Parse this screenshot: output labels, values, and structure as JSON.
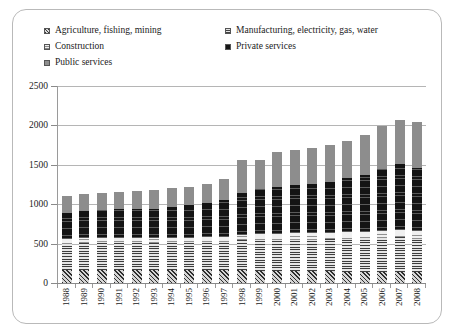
{
  "chart_data": {
    "type": "bar",
    "stacked": true,
    "title": "",
    "subtitle": "",
    "xlabel": "",
    "ylabel": "",
    "ylim": [
      0,
      2500
    ],
    "yticks": [
      0,
      500,
      1000,
      1500,
      2000,
      2500
    ],
    "grid": true,
    "legend_position": "top",
    "categories": [
      "1988",
      "1989",
      "1990",
      "1991",
      "1992",
      "1993",
      "1994",
      "1995",
      "1996",
      "1997",
      "1998",
      "1999",
      "2000",
      "2001",
      "2002",
      "2003",
      "2004",
      "2005",
      "2006",
      "2007",
      "2008"
    ],
    "series": [
      {
        "name": "Agriculture, fishing, mining",
        "pattern": "diagonal-hatch",
        "values": [
          170,
          170,
          170,
          170,
          170,
          165,
          165,
          160,
          160,
          160,
          160,
          155,
          155,
          150,
          150,
          150,
          145,
          145,
          140,
          140,
          135
        ]
      },
      {
        "name": "Manufacturing, electricity, gas, water",
        "pattern": "horizontal-stripes",
        "values": [
          330,
          340,
          345,
          345,
          345,
          345,
          350,
          355,
          360,
          365,
          380,
          390,
          395,
          400,
          400,
          405,
          415,
          420,
          430,
          440,
          430
        ]
      },
      {
        "name": "Construction",
        "pattern": "light-dotted",
        "values": [
          60,
          60,
          60,
          60,
          60,
          60,
          60,
          60,
          60,
          65,
          70,
          75,
          75,
          80,
          80,
          80,
          85,
          85,
          90,
          95,
          90
        ]
      },
      {
        "name": "Private services",
        "pattern": "solid-black",
        "values": [
          330,
          340,
          355,
          360,
          365,
          375,
          390,
          410,
          430,
          470,
          530,
          570,
          600,
          620,
          630,
          650,
          690,
          720,
          790,
          830,
          800
        ]
      },
      {
        "name": "Public services",
        "pattern": "solid-gray",
        "values": [
          210,
          215,
          215,
          220,
          225,
          230,
          235,
          240,
          250,
          260,
          420,
          370,
          440,
          440,
          450,
          470,
          470,
          510,
          540,
          560,
          590
        ]
      }
    ],
    "totals": [
      1100,
      1125,
      1145,
      1155,
      1165,
      1175,
      1200,
      1225,
      1260,
      1320,
      1560,
      1560,
      1665,
      1690,
      1710,
      1755,
      1805,
      1880,
      1990,
      2065,
      2045
    ]
  },
  "legend": {
    "items": [
      {
        "label": "Agriculture, fishing, mining",
        "swatch": "diagonal-hatch-swatch"
      },
      {
        "label": "Construction",
        "swatch": "light-dotted-swatch"
      },
      {
        "label": "Public services",
        "swatch": "solid-gray-swatch"
      },
      {
        "label": "Manufacturing, electricity, gas, water",
        "swatch": "horizontal-stripes-swatch"
      },
      {
        "label": "Private services",
        "swatch": "solid-black-swatch"
      }
    ]
  },
  "axes": {
    "y_tick_labels": [
      "2500",
      "2000",
      "1500",
      "1000",
      "500",
      "0"
    ],
    "x_tick_labels": [
      "1988",
      "1989",
      "1990",
      "1991",
      "1992",
      "1993",
      "1994",
      "1995",
      "1996",
      "1997",
      "1998",
      "1999",
      "2000",
      "2001",
      "2002",
      "2003",
      "2004",
      "2005",
      "2006",
      "2007",
      "2008"
    ]
  },
  "colors": {
    "agriculture": "#2e2e2e",
    "manufacturing": "#3d3d3d",
    "construction": "#909090",
    "private_services": "#141414",
    "public_services": "#8d8d8d",
    "gridline": "#b5b5b5",
    "axis": "#8a8a8a",
    "border": "#b9b9b9",
    "background": "#ffffff"
  }
}
